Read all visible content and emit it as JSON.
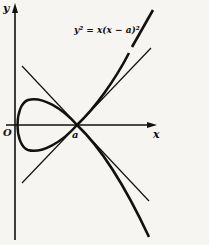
{
  "figure": {
    "equation": "y² = x(x − a)²",
    "axis_labels": {
      "x": "x",
      "y": "y"
    },
    "point_labels": {
      "origin": "O",
      "node": "a"
    },
    "colors": {
      "ink": "#111111",
      "paper": "#f6f5f2"
    }
  }
}
